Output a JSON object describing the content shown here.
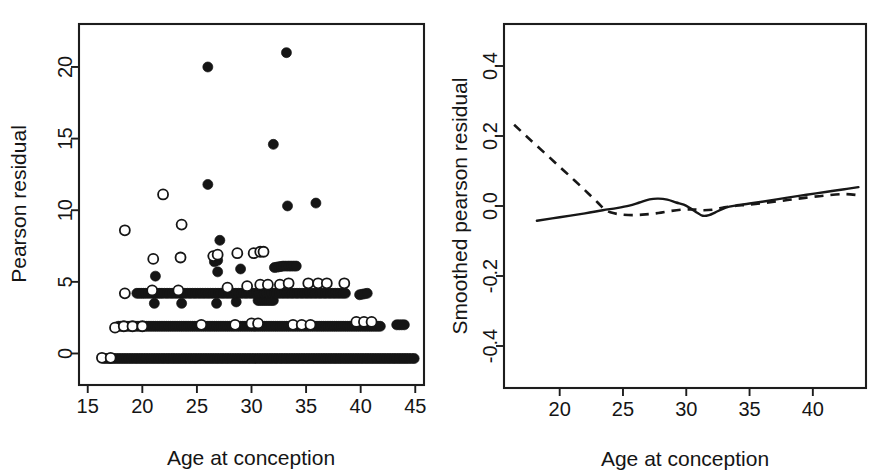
{
  "figure": {
    "background_color": "#ffffff",
    "ink_color": "#151515",
    "panel_count": 2
  },
  "chart_data": [
    {
      "panel": "left",
      "type": "scatter",
      "title": "",
      "xlabel": "Age at conception",
      "ylabel": "Pearson residual",
      "xlim": [
        14.2,
        45.8
      ],
      "ylim": [
        -2.2,
        23.0
      ],
      "xticks": [
        15,
        20,
        25,
        30,
        35,
        40,
        45
      ],
      "xticklabels": [
        "15",
        "20",
        "25",
        "30",
        "35",
        "40",
        "45"
      ],
      "yticks": [
        0,
        5,
        10,
        15,
        20
      ],
      "yticklabels": [
        "0",
        "5",
        "10",
        "15",
        "20"
      ],
      "grid": false,
      "legend": "none",
      "series": [
        {
          "name": "filled-circle-group",
          "marker": "filled circle",
          "marker_fill": "#151515",
          "points": [
            [
              33.2,
              21.0
            ],
            [
              26.0,
              20.0
            ],
            [
              32.0,
              14.6
            ],
            [
              26.0,
              11.8
            ],
            [
              33.3,
              10.3
            ],
            [
              35.9,
              10.5
            ],
            [
              27.1,
              7.9
            ],
            [
              26.9,
              6.5
            ],
            [
              26.6,
              6.4
            ],
            [
              21.2,
              5.4
            ],
            [
              26.9,
              5.7
            ],
            [
              29.0,
              5.9
            ],
            [
              32.1,
              6.0
            ],
            [
              32.9,
              6.1
            ],
            [
              33.4,
              6.1
            ],
            [
              34.1,
              6.1
            ],
            [
              21.1,
              3.5
            ],
            [
              23.6,
              3.5
            ],
            [
              26.8,
              3.5
            ],
            [
              28.6,
              3.6
            ],
            [
              30.6,
              3.7
            ],
            [
              31.4,
              3.7
            ],
            [
              32.0,
              3.7
            ],
            [
              39.9,
              4.1
            ],
            [
              40.6,
              4.2
            ],
            [
              19.5,
              4.2
            ],
            [
              20.3,
              4.2
            ],
            [
              21.0,
              4.2
            ],
            [
              21.8,
              4.2
            ],
            [
              22.5,
              4.2
            ],
            [
              23.2,
              4.2
            ],
            [
              23.9,
              4.2
            ],
            [
              24.6,
              4.2
            ],
            [
              25.3,
              4.2
            ],
            [
              26.0,
              4.2
            ],
            [
              26.7,
              4.2
            ],
            [
              27.4,
              4.2
            ],
            [
              28.1,
              4.2
            ],
            [
              28.8,
              4.2
            ],
            [
              29.5,
              4.2
            ],
            [
              30.2,
              4.2
            ],
            [
              30.9,
              4.2
            ],
            [
              31.6,
              4.2
            ],
            [
              32.3,
              4.2
            ],
            [
              33.0,
              4.2
            ],
            [
              33.7,
              4.2
            ],
            [
              34.4,
              4.2
            ],
            [
              35.1,
              4.2
            ],
            [
              35.8,
              4.2
            ],
            [
              36.5,
              4.2
            ],
            [
              37.2,
              4.2
            ],
            [
              37.9,
              4.2
            ],
            [
              38.6,
              4.2
            ],
            [
              17.8,
              1.9
            ],
            [
              18.6,
              1.9
            ],
            [
              19.4,
              1.9
            ],
            [
              20.2,
              1.9
            ],
            [
              21.0,
              1.9
            ],
            [
              21.8,
              1.9
            ],
            [
              22.6,
              1.9
            ],
            [
              23.4,
              1.9
            ],
            [
              24.2,
              1.9
            ],
            [
              25.0,
              1.9
            ],
            [
              25.8,
              1.9
            ],
            [
              26.6,
              1.9
            ],
            [
              27.4,
              1.9
            ],
            [
              28.2,
              1.9
            ],
            [
              29.0,
              1.9
            ],
            [
              29.8,
              1.9
            ],
            [
              30.6,
              1.9
            ],
            [
              31.4,
              1.9
            ],
            [
              32.2,
              1.9
            ],
            [
              33.0,
              1.9
            ],
            [
              33.8,
              1.9
            ],
            [
              34.6,
              1.9
            ],
            [
              35.4,
              1.9
            ],
            [
              36.2,
              1.9
            ],
            [
              37.0,
              1.9
            ],
            [
              37.8,
              1.9
            ],
            [
              38.6,
              1.9
            ],
            [
              39.4,
              1.9
            ],
            [
              40.2,
              1.9
            ],
            [
              41.0,
              1.9
            ],
            [
              41.8,
              1.9
            ],
            [
              43.3,
              2.0
            ],
            [
              44.0,
              2.0
            ],
            [
              16.5,
              -0.35
            ],
            [
              17.4,
              -0.35
            ],
            [
              18.3,
              -0.35
            ],
            [
              19.2,
              -0.35
            ],
            [
              20.1,
              -0.35
            ],
            [
              21.0,
              -0.35
            ],
            [
              21.9,
              -0.35
            ],
            [
              22.8,
              -0.35
            ],
            [
              23.7,
              -0.35
            ],
            [
              24.6,
              -0.35
            ],
            [
              25.5,
              -0.35
            ],
            [
              26.4,
              -0.35
            ],
            [
              27.3,
              -0.35
            ],
            [
              28.2,
              -0.35
            ],
            [
              29.1,
              -0.35
            ],
            [
              30.0,
              -0.35
            ],
            [
              30.9,
              -0.35
            ],
            [
              31.8,
              -0.35
            ],
            [
              32.7,
              -0.35
            ],
            [
              33.6,
              -0.35
            ],
            [
              34.5,
              -0.35
            ],
            [
              35.4,
              -0.35
            ],
            [
              36.3,
              -0.35
            ],
            [
              37.2,
              -0.35
            ],
            [
              38.1,
              -0.35
            ],
            [
              39.0,
              -0.35
            ],
            [
              39.9,
              -0.35
            ],
            [
              40.8,
              -0.35
            ],
            [
              41.7,
              -0.35
            ],
            [
              42.6,
              -0.35
            ],
            [
              43.5,
              -0.35
            ],
            [
              44.4,
              -0.35
            ],
            [
              44.9,
              -0.35
            ]
          ]
        },
        {
          "name": "open-circle-group",
          "marker": "open circle",
          "marker_fill": "#ffffff",
          "points": [
            [
              21.9,
              11.1
            ],
            [
              18.4,
              8.6
            ],
            [
              23.6,
              9.0
            ],
            [
              21.0,
              6.6
            ],
            [
              23.5,
              6.7
            ],
            [
              26.5,
              6.8
            ],
            [
              26.9,
              6.9
            ],
            [
              28.7,
              7.0
            ],
            [
              30.2,
              7.0
            ],
            [
              30.8,
              7.1
            ],
            [
              31.1,
              7.1
            ],
            [
              18.4,
              4.2
            ],
            [
              20.9,
              4.4
            ],
            [
              23.3,
              4.4
            ],
            [
              27.8,
              4.6
            ],
            [
              29.6,
              4.7
            ],
            [
              30.8,
              4.8
            ],
            [
              31.5,
              4.8
            ],
            [
              32.6,
              4.8
            ],
            [
              33.4,
              4.9
            ],
            [
              35.2,
              4.9
            ],
            [
              36.1,
              4.9
            ],
            [
              36.9,
              4.9
            ],
            [
              38.5,
              4.9
            ],
            [
              17.5,
              1.8
            ],
            [
              18.3,
              1.9
            ],
            [
              19.1,
              1.9
            ],
            [
              20.0,
              1.9
            ],
            [
              25.4,
              2.0
            ],
            [
              28.5,
              2.0
            ],
            [
              30.0,
              2.1
            ],
            [
              30.6,
              2.1
            ],
            [
              39.6,
              2.2
            ],
            [
              40.3,
              2.2
            ],
            [
              41.0,
              2.2
            ],
            [
              16.3,
              -0.3
            ],
            [
              17.1,
              -0.3
            ],
            [
              33.8,
              2.0
            ],
            [
              34.6,
              2.0
            ],
            [
              35.4,
              2.0
            ]
          ]
        }
      ]
    },
    {
      "panel": "right",
      "type": "line",
      "title": "",
      "xlabel": "Age at conception",
      "ylabel": "Smoothed pearson residual",
      "xlim": [
        15.6,
        44.2
      ],
      "ylim": [
        -0.52,
        0.52
      ],
      "xticks": [
        20,
        25,
        30,
        35,
        40
      ],
      "xticklabels": [
        "20",
        "25",
        "30",
        "35",
        "40"
      ],
      "yticks": [
        -0.4,
        -0.2,
        0.0,
        0.2,
        0.4
      ],
      "yticklabels": [
        "-0.4",
        "-0.2",
        "0.0",
        "0.2",
        "0.4"
      ],
      "grid": false,
      "legend": "none",
      "series": [
        {
          "name": "smoothed-solid",
          "style": "solid",
          "points": [
            [
              18.2,
              -0.042
            ],
            [
              20.0,
              -0.032
            ],
            [
              22.0,
              -0.021
            ],
            [
              23.4,
              -0.012
            ],
            [
              24.5,
              -0.006
            ],
            [
              25.5,
              0.001
            ],
            [
              26.3,
              0.01
            ],
            [
              27.1,
              0.019
            ],
            [
              27.8,
              0.021
            ],
            [
              28.5,
              0.018
            ],
            [
              29.2,
              0.01
            ],
            [
              29.8,
              0.004
            ],
            [
              30.3,
              -0.006
            ],
            [
              30.9,
              -0.02
            ],
            [
              31.3,
              -0.028
            ],
            [
              31.8,
              -0.026
            ],
            [
              32.3,
              -0.018
            ],
            [
              32.9,
              -0.008
            ],
            [
              33.4,
              -0.002
            ],
            [
              34.0,
              0.002
            ],
            [
              35.0,
              0.007
            ],
            [
              36.5,
              0.015
            ],
            [
              38.0,
              0.024
            ],
            [
              39.5,
              0.032
            ],
            [
              41.0,
              0.04
            ],
            [
              42.5,
              0.048
            ],
            [
              43.6,
              0.054
            ]
          ]
        },
        {
          "name": "smoothed-dashed",
          "style": "dashed",
          "points": [
            [
              16.4,
              0.232
            ],
            [
              17.5,
              0.195
            ],
            [
              18.8,
              0.152
            ],
            [
              20.0,
              0.112
            ],
            [
              21.2,
              0.072
            ],
            [
              22.2,
              0.038
            ],
            [
              23.0,
              0.01
            ],
            [
              23.5,
              -0.008
            ],
            [
              24.0,
              -0.018
            ],
            [
              24.8,
              -0.024
            ],
            [
              25.8,
              -0.026
            ],
            [
              26.8,
              -0.024
            ],
            [
              27.8,
              -0.02
            ],
            [
              28.8,
              -0.014
            ],
            [
              29.8,
              -0.01
            ],
            [
              30.6,
              -0.01
            ],
            [
              31.4,
              -0.012
            ],
            [
              32.2,
              -0.01
            ],
            [
              33.0,
              -0.004
            ],
            [
              33.8,
              0.0
            ],
            [
              35.0,
              0.004
            ],
            [
              36.5,
              0.01
            ],
            [
              38.0,
              0.017
            ],
            [
              39.5,
              0.024
            ],
            [
              41.0,
              0.03
            ],
            [
              42.5,
              0.034
            ],
            [
              43.6,
              0.031
            ]
          ]
        }
      ]
    }
  ]
}
